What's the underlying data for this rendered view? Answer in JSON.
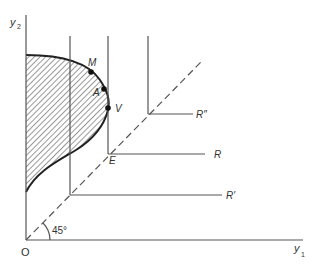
{
  "diagram": {
    "type": "economics-production-possibility",
    "axes": {
      "x_label": "y",
      "x_subscript": "1",
      "y_label": "y",
      "y_subscript": "2",
      "origin_label": "O"
    },
    "angle_label": "45°",
    "points": {
      "M": "M",
      "A": "A",
      "V": "V",
      "E": "E"
    },
    "rays": {
      "R": "R",
      "R_prime": "R′",
      "R_double_prime": "R″"
    },
    "colors": {
      "line": "#555555",
      "curve": "#222222",
      "hatch": "#555555",
      "text": "#333333"
    }
  }
}
